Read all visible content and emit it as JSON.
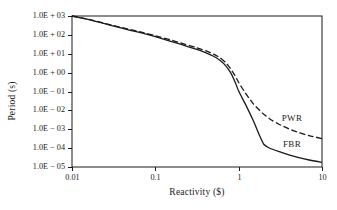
{
  "chart_data": {
    "type": "line",
    "title": "",
    "xlabel": "Reactivity ($)",
    "ylabel": "Period (s)",
    "xscale": "log",
    "yscale": "log",
    "xlim": [
      0.01,
      10
    ],
    "ylim": [
      1e-05,
      1000
    ],
    "grid": false,
    "legend_position": "inline-right",
    "xticks": [
      "0.01",
      "0.1",
      "1",
      "10"
    ],
    "xtick_values": [
      0.01,
      0.1,
      1,
      10
    ],
    "yticks": [
      "1.0E + 03",
      "1.0E + 02",
      "1.0E + 01",
      "1.0E + 00",
      "1.0E − 01",
      "1.0E − 02",
      "1.0E − 03",
      "1.0E − 04",
      "1.0E − 05"
    ],
    "ytick_values": [
      1000,
      100,
      10,
      1,
      0.1,
      0.01,
      0.001,
      0.0001,
      1e-05
    ],
    "series": [
      {
        "name": "PWR",
        "style": "dashed",
        "color": "#1a1a1a",
        "x": [
          0.01,
          0.015,
          0.02,
          0.03,
          0.05,
          0.07,
          0.1,
          0.15,
          0.2,
          0.3,
          0.4,
          0.5,
          0.6,
          0.7,
          0.8,
          0.9,
          1.0,
          1.2,
          1.5,
          2.0,
          2.5,
          3.0,
          4.0,
          5.0,
          7.0,
          10.0
        ],
        "y": [
          1000,
          700,
          520,
          330,
          190,
          135,
          90,
          55,
          38,
          22,
          14.5,
          9.5,
          6.0,
          3.4,
          1.6,
          0.72,
          0.3,
          0.085,
          0.022,
          0.0062,
          0.003,
          0.0019,
          0.00105,
          0.00072,
          0.00046,
          0.00032
        ]
      },
      {
        "name": "FBR",
        "style": "solid",
        "color": "#1a1a1a",
        "x": [
          0.01,
          0.015,
          0.02,
          0.03,
          0.05,
          0.07,
          0.1,
          0.15,
          0.2,
          0.3,
          0.4,
          0.5,
          0.6,
          0.7,
          0.8,
          0.9,
          1.0,
          1.2,
          1.5,
          1.8,
          2.0,
          2.3,
          3.0,
          4.0,
          5.0,
          7.0,
          10.0
        ],
        "y": [
          1000,
          690,
          500,
          310,
          175,
          122,
          80,
          47,
          32,
          18,
          11.5,
          7.4,
          4.4,
          2.3,
          1.0,
          0.34,
          0.105,
          0.022,
          0.0028,
          0.00042,
          0.00016,
          0.000105,
          6.65e-05,
          4.45e-05,
          3.35e-05,
          2.35e-05,
          1.75e-05
        ]
      }
    ],
    "annotations": [
      {
        "text": "PWR",
        "x_px": 292,
        "y_px": 118
      },
      {
        "text": "FBR",
        "x_px": 292,
        "y_px": 144
      }
    ]
  },
  "axis": {
    "frame_color": "#1a1a1a"
  }
}
